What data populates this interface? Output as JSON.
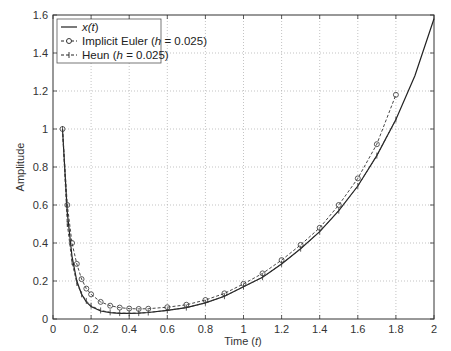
{
  "chart_data": {
    "type": "line",
    "title": "",
    "xlabel": "Time (t)",
    "ylabel": "Amplitude",
    "xlim": [
      0,
      2
    ],
    "ylim": [
      0,
      1.6
    ],
    "xticks": [
      "0",
      "0.2",
      "0.4",
      "0.6",
      "0.8",
      "1",
      "1.2",
      "1.4",
      "1.6",
      "1.8",
      "2"
    ],
    "yticks": [
      "0",
      "0.2",
      "0.4",
      "0.6",
      "0.8",
      "1",
      "1.2",
      "1.4",
      "1.6"
    ],
    "grid": true,
    "legend_position": "upper left",
    "legend": [
      {
        "name": "x(t)",
        "style": "solid line"
      },
      {
        "name": "Implicit Euler (h = 0.025)",
        "style": "circle markers, dashed"
      },
      {
        "name": "Heun (h = 0.025)",
        "style": "plus markers, dashed"
      }
    ],
    "series": [
      {
        "name": "x(t)",
        "x": [
          0.05,
          0.075,
          0.1,
          0.125,
          0.15,
          0.175,
          0.2,
          0.25,
          0.3,
          0.35,
          0.4,
          0.45,
          0.5,
          0.6,
          0.7,
          0.8,
          0.9,
          1.0,
          1.1,
          1.2,
          1.3,
          1.4,
          1.5,
          1.6,
          1.7,
          1.8,
          1.9,
          2.0
        ],
        "values": [
          1.0,
          0.56,
          0.33,
          0.2,
          0.13,
          0.09,
          0.065,
          0.042,
          0.033,
          0.03,
          0.03,
          0.031,
          0.034,
          0.045,
          0.06,
          0.085,
          0.12,
          0.17,
          0.22,
          0.29,
          0.37,
          0.46,
          0.57,
          0.7,
          0.86,
          1.05,
          1.28,
          1.58
        ]
      },
      {
        "name": "Implicit Euler (h = 0.025)",
        "x": [
          0.05,
          0.075,
          0.1,
          0.125,
          0.15,
          0.175,
          0.2,
          0.25,
          0.3,
          0.35,
          0.4,
          0.45,
          0.5,
          0.6,
          0.7,
          0.8,
          0.9,
          1.0,
          1.1,
          1.2,
          1.3,
          1.4,
          1.5,
          1.6,
          1.7,
          1.8
        ],
        "values": [
          1.0,
          0.6,
          0.4,
          0.29,
          0.21,
          0.16,
          0.13,
          0.09,
          0.07,
          0.06,
          0.055,
          0.053,
          0.054,
          0.062,
          0.075,
          0.1,
          0.135,
          0.185,
          0.24,
          0.31,
          0.39,
          0.48,
          0.6,
          0.74,
          0.92,
          1.18
        ]
      },
      {
        "name": "Heun (h = 0.025)",
        "x": [
          0.05,
          0.075,
          0.1,
          0.125,
          0.15,
          0.175,
          0.2,
          0.25,
          0.3,
          0.35,
          0.4,
          0.45,
          0.5,
          0.6,
          0.7,
          0.8,
          0.9,
          1.0,
          1.1,
          1.2,
          1.3,
          1.4,
          1.5,
          1.6,
          1.7,
          1.8
        ],
        "values": [
          1.0,
          0.5,
          0.3,
          0.19,
          0.13,
          0.095,
          0.07,
          0.045,
          0.035,
          0.031,
          0.03,
          0.031,
          0.034,
          0.045,
          0.06,
          0.085,
          0.12,
          0.17,
          0.22,
          0.29,
          0.37,
          0.46,
          0.57,
          0.7,
          0.86,
          1.05
        ]
      }
    ]
  },
  "labels": {
    "xlabel_main": "Time (",
    "xlabel_var": "t",
    "xlabel_end": ")",
    "ylabel": "Amplitude",
    "legend_1_pre": "x(",
    "legend_1_var": "t",
    "legend_1_end": ")",
    "legend_2_pre": "Implicit Euler (",
    "legend_2_var": "h",
    "legend_2_end": " = 0.025)",
    "legend_3_pre": "Heun (",
    "legend_3_var": "h",
    "legend_3_end": " = 0.025)"
  }
}
